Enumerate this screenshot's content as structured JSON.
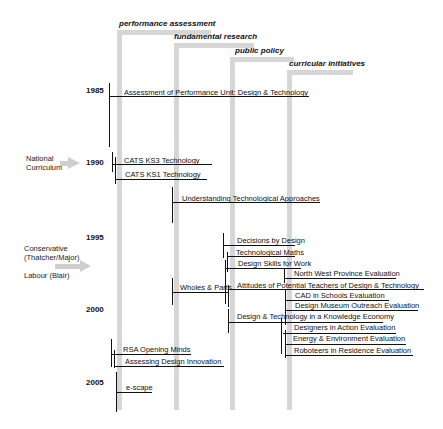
{
  "strands": [
    {
      "label": "performance assessment",
      "x": 119
    },
    {
      "label": "fundamental research",
      "x": 176
    },
    {
      "label": "public policy",
      "x": 232
    },
    {
      "label": "curricular initiatives",
      "x": 288
    }
  ],
  "years": [
    {
      "label": "1985",
      "y": 90
    },
    {
      "label": "1990",
      "y": 160
    },
    {
      "label": "1995",
      "y": 236
    },
    {
      "label": "2000",
      "y": 308
    },
    {
      "label": "2005",
      "y": 380
    }
  ],
  "context": {
    "national_curriculum": "National Curriculum",
    "national_curriculum_line1": "National",
    "national_curriculum_line2": "Curriculum",
    "conservative_line1": "Conservative",
    "conservative_line2": "(Thatcher/Major)",
    "labour": "Labour (Blair)"
  },
  "projects": [
    {
      "label": "Assessment of Performance Unit: Design & Technology",
      "strand": "performance assessment"
    },
    {
      "label": "CATS KS3 Technology",
      "strand": "performance assessment"
    },
    {
      "label": "CATS KS1 Technology",
      "strand": "performance assessment"
    },
    {
      "label": "Understanding Technological Approaches",
      "strand": "fundamental research"
    },
    {
      "label": "Decisions by Design",
      "strand": "public policy"
    },
    {
      "label": "Technological Maths",
      "strand": "public policy"
    },
    {
      "label": "Design Skills for Work",
      "strand": "public policy"
    },
    {
      "label": "North West Province Evaluation",
      "strand": "curricular initiatives"
    },
    {
      "label": "Wholes & Parts",
      "strand": "fundamental research"
    },
    {
      "label": "Attitudes of Potential Teachers of Design & Technology",
      "strand": "public policy"
    },
    {
      "label": "CAD in Schools Evaluation",
      "strand": "curricular initiatives"
    },
    {
      "label": "Design Museum Outreach Evaluation",
      "strand": "curricular initiatives"
    },
    {
      "label": "Design & Technology in a Knowledge Economy",
      "strand": "public policy"
    },
    {
      "label": "Designers in Action Evaluation",
      "strand": "curricular initiatives"
    },
    {
      "label": "Energy & Environment Evaluation",
      "strand": "curricular initiatives"
    },
    {
      "label": "Roboteers in Residence Evaluation",
      "strand": "curricular initiatives"
    },
    {
      "label": "RSA Opening Minds",
      "strand": "performance assessment"
    },
    {
      "label": "Assessing Design Innovation",
      "strand": "performance assessment"
    },
    {
      "label": "e-scape",
      "strand": "performance assessment"
    }
  ]
}
